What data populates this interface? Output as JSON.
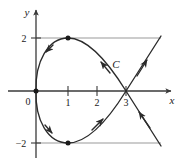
{
  "figure": {
    "title": "",
    "background_color": "#ffffff",
    "axis_color": "#3a3a3a",
    "curve_color": "#2b2b2b",
    "gridline_color": "#9a9a9a",
    "point_color": "#1a1a1a"
  },
  "axes": {
    "x_label": "x",
    "y_label": "y",
    "origin_label": "0",
    "x_ticks": [
      {
        "value": 1,
        "label": "1"
      },
      {
        "value": 2,
        "label": "2"
      },
      {
        "value": 3,
        "label": "3"
      }
    ],
    "y_ticks": [
      {
        "value": 2,
        "label": "2"
      },
      {
        "value": -2,
        "label": "−2"
      }
    ],
    "x_range": [
      -0.5,
      4.7
    ],
    "y_range": [
      -2.9,
      3.1
    ]
  },
  "curve": {
    "name_label": "C",
    "description": "parametric closed loop with self-intersection",
    "self_intersection": {
      "x": 3,
      "y": 0
    },
    "marked_points": [
      {
        "x": 0,
        "y": 0,
        "label": ""
      },
      {
        "x": 1,
        "y": 2,
        "label": ""
      },
      {
        "x": 1,
        "y": -2,
        "label": ""
      }
    ],
    "gridlines": [
      {
        "y": 2,
        "x_start": 0,
        "x_end": 4.3
      },
      {
        "y": -2,
        "x_start": 0,
        "x_end": 4.3
      }
    ],
    "direction_arrows": [
      {
        "at_x": 0.45,
        "at_y": 1.72,
        "heading": "down-left"
      },
      {
        "at_x": 2.25,
        "at_y": 1.25,
        "heading": "up-left"
      },
      {
        "at_x": 3.95,
        "at_y": 1.35,
        "heading": "up-right"
      },
      {
        "at_x": 0.45,
        "at_y": -1.7,
        "heading": "down-right"
      },
      {
        "at_x": 2.2,
        "at_y": -1.3,
        "heading": "up-right"
      },
      {
        "at_x": 3.85,
        "at_y": -1.1,
        "heading": "up-left"
      }
    ]
  }
}
